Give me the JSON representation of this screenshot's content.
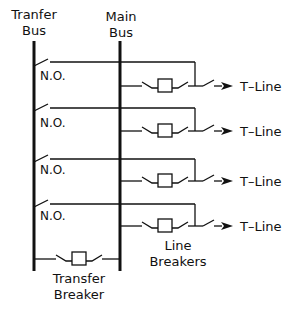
{
  "diagram": {
    "type": "single-line electrical diagram",
    "labels": {
      "transfer_bus_line1": "Tranfer",
      "transfer_bus_line2": "Bus",
      "main_bus_line1": "Main",
      "main_bus_line2": "Bus",
      "line_breakers_line1": "Line",
      "line_breakers_line2": "Breakers",
      "transfer_breaker_line1": "Transfer",
      "transfer_breaker_line2": "Breaker"
    },
    "bays": [
      {
        "switch_label": "N.O.",
        "output_label": "T–Line"
      },
      {
        "switch_label": "N.O.",
        "output_label": "T–Line"
      },
      {
        "switch_label": "N.O.",
        "output_label": "T–Line"
      },
      {
        "switch_label": "N.O.",
        "output_label": "T–Line"
      }
    ],
    "colors": {
      "line": "#111111",
      "background": "#ffffff"
    }
  }
}
